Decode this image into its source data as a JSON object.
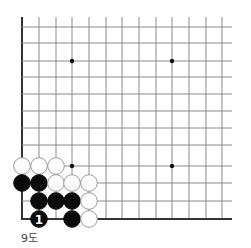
{
  "diagram": {
    "caption": "9도",
    "grid": {
      "origin_x": 22,
      "origin_y": 27,
      "spacing_x": 16.7,
      "spacing_y": 16.0,
      "columns": 13,
      "rows": 13,
      "right_extent": 232,
      "bottom_y": 219,
      "line_color": "#8a8a8a",
      "edge_color": "#333333"
    },
    "star_points": [
      {
        "col": 3,
        "row": 2
      },
      {
        "col": 9,
        "row": 2
      },
      {
        "col": 3,
        "row": 8
      },
      {
        "col": 9,
        "row": 8
      }
    ],
    "stones": [
      {
        "color": "white",
        "col": 0,
        "row": 8
      },
      {
        "color": "white",
        "col": 1,
        "row": 8
      },
      {
        "color": "white",
        "col": 2,
        "row": 8
      },
      {
        "color": "black",
        "col": 0,
        "row": 9
      },
      {
        "color": "black",
        "col": 1,
        "row": 9
      },
      {
        "color": "white",
        "col": 2,
        "row": 9
      },
      {
        "color": "white",
        "col": 3,
        "row": 9
      },
      {
        "color": "white",
        "col": 4,
        "row": 9
      },
      {
        "color": "black",
        "col": 1,
        "row": 10
      },
      {
        "color": "black",
        "col": 2,
        "row": 10
      },
      {
        "color": "black",
        "col": 3,
        "row": 10
      },
      {
        "color": "white",
        "col": 4,
        "row": 10
      },
      {
        "color": "black",
        "col": 1,
        "row": 11,
        "label": "1"
      },
      {
        "color": "black",
        "col": 3,
        "row": 11
      },
      {
        "color": "white",
        "col": 4,
        "row": 11
      }
    ]
  }
}
